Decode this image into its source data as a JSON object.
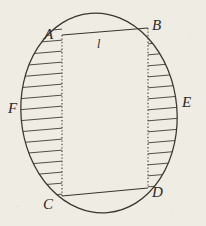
{
  "figure": {
    "kind": "geometry-diagram",
    "paper_color": "#efece4",
    "ink_color": "#3a352e",
    "hatch_color": "#4a443c",
    "labels": {
      "a": "A",
      "b": "B",
      "c": "C",
      "d": "D",
      "e": "E",
      "f": "F",
      "length": "l"
    },
    "label_positions": {
      "a": {
        "x": 44,
        "y": 27
      },
      "b": {
        "x": 152,
        "y": 18
      },
      "c": {
        "x": 43,
        "y": 197
      },
      "d": {
        "x": 152,
        "y": 185
      },
      "e": {
        "x": 182,
        "y": 95
      },
      "f": {
        "x": 8,
        "y": 101
      },
      "length": {
        "x": 97,
        "y": 38
      }
    },
    "oval": {
      "center_x": 99,
      "center_y": 113,
      "radius_x": 78,
      "radius_y": 100,
      "rotation_deg": -5
    },
    "rectangle": {
      "ax": 62,
      "ay": 35,
      "bx": 148,
      "by": 28,
      "cx": 62,
      "cy": 196,
      "dx": 148,
      "dy": 188,
      "top_style": "solid",
      "bottom_style": "solid",
      "left_style": "dotted",
      "right_style": "dotted"
    },
    "hatching": {
      "orientation": "horizontal",
      "spacing_px": 11,
      "left_region": "between oval arc F and segment AC",
      "right_region": "between segment BD and oval arc E"
    }
  }
}
